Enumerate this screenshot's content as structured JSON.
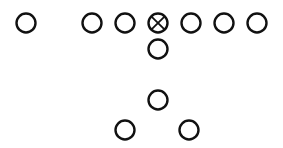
{
  "diagram": {
    "type": "football-formation",
    "stroke_color": "#111111",
    "background": "#ffffff",
    "radius": 9.5,
    "players": [
      {
        "id": "split-end",
        "x": 26,
        "y": 23,
        "marker": "circle"
      },
      {
        "id": "left-tackle",
        "x": 92,
        "y": 23,
        "marker": "circle"
      },
      {
        "id": "left-guard",
        "x": 125,
        "y": 23,
        "marker": "circle"
      },
      {
        "id": "center",
        "x": 158,
        "y": 23,
        "marker": "circle-x"
      },
      {
        "id": "right-guard",
        "x": 191,
        "y": 23,
        "marker": "circle"
      },
      {
        "id": "right-tackle",
        "x": 224,
        "y": 23,
        "marker": "circle"
      },
      {
        "id": "tight-end",
        "x": 257,
        "y": 23,
        "marker": "circle"
      },
      {
        "id": "quarterback",
        "x": 158,
        "y": 49,
        "marker": "circle"
      },
      {
        "id": "fullback",
        "x": 158,
        "y": 100,
        "marker": "circle"
      },
      {
        "id": "left-halfback",
        "x": 125,
        "y": 130,
        "marker": "circle"
      },
      {
        "id": "right-halfback",
        "x": 189,
        "y": 130,
        "marker": "circle"
      }
    ]
  }
}
